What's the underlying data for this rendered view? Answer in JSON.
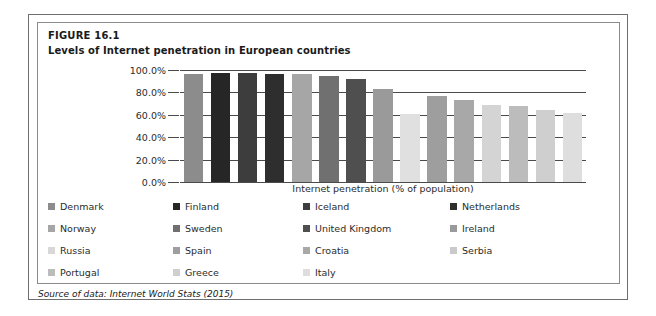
{
  "figure": {
    "label": "FIGURE 16.1",
    "title": "Levels of Internet penetration in European countries",
    "source": "Source of data: Internet World Stats (2015)"
  },
  "chart_data": {
    "type": "bar",
    "title": "Levels of Internet penetration in European countries",
    "xlabel": "Internet penetration (% of population)",
    "ylabel": "",
    "ylim": [
      0,
      100
    ],
    "grid": true,
    "legend_position": "bottom",
    "ytick_labels": [
      "100.0%",
      "80.0%",
      "60.0%",
      "40.0%",
      "20.0%",
      "0.0%"
    ],
    "ytick_values": [
      100,
      80,
      60,
      40,
      20,
      0
    ],
    "categories": [
      "Denmark",
      "Finland",
      "Iceland",
      "Netherlands",
      "Norway",
      "Sweden",
      "United Kingdom",
      "Ireland",
      "Russia",
      "Spain",
      "Croatia",
      "Serbia",
      "Portugal",
      "Greece",
      "Italy"
    ],
    "values": [
      96,
      97,
      97,
      96,
      96,
      95,
      92,
      83,
      61,
      77,
      73,
      69,
      68,
      64,
      62
    ],
    "colors": [
      "#8c8c8c",
      "#262626",
      "#3d3d3d",
      "#2e2e2e",
      "#a6a6a6",
      "#707070",
      "#4f4f4f",
      "#9a9a9a",
      "#e0e0e0",
      "#9e9e9e",
      "#a8a8a8",
      "#d4d4d4",
      "#bcbcbc",
      "#cfcfcf",
      "#dedede"
    ]
  },
  "legend": {
    "rows": [
      [
        {
          "label": "Denmark",
          "color": "#8c8c8c"
        },
        {
          "label": "Finland",
          "color": "#262626"
        },
        {
          "label": "Iceland",
          "color": "#3d3d3d"
        },
        {
          "label": "Netherlands",
          "color": "#2e2e2e"
        }
      ],
      [
        {
          "label": "Norway",
          "color": "#a6a6a6"
        },
        {
          "label": "Sweden",
          "color": "#707070"
        },
        {
          "label": "United Kingdom",
          "color": "#4f4f4f"
        },
        {
          "label": "Ireland",
          "color": "#9a9a9a"
        }
      ],
      [
        {
          "label": "Russia",
          "color": "#d8d8d8"
        },
        {
          "label": "Spain",
          "color": "#9e9e9e"
        },
        {
          "label": "Croatia",
          "color": "#a8a8a8"
        },
        {
          "label": "Serbia",
          "color": "#cacaca"
        }
      ],
      [
        {
          "label": "Portugal",
          "color": "#bcbcbc"
        },
        {
          "label": "Greece",
          "color": "#cfcfcf"
        },
        {
          "label": "Italy",
          "color": "#dedede"
        }
      ]
    ],
    "column_x": [
      10,
      135,
      265,
      412
    ]
  }
}
